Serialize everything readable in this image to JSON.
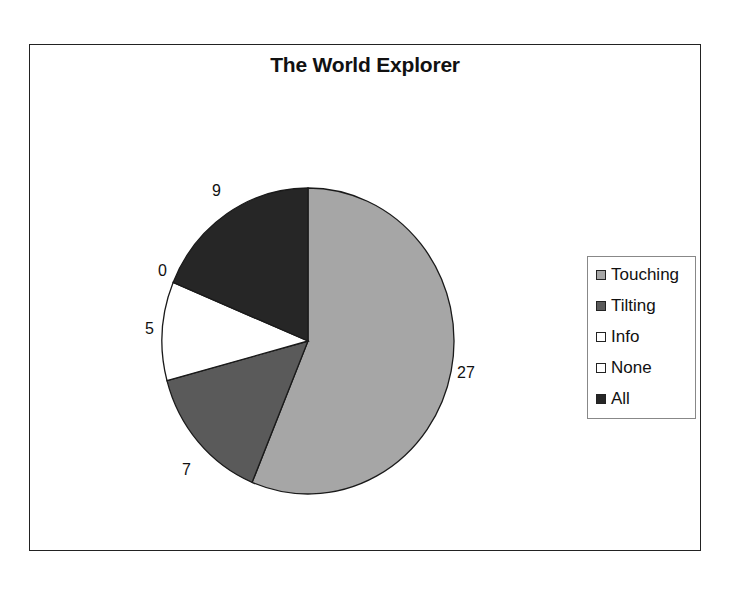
{
  "chart_data": {
    "type": "pie",
    "title": "The World Explorer",
    "categories": [
      "Touching",
      "Tilting",
      "Info",
      "None",
      "All"
    ],
    "values": [
      27,
      7,
      5,
      0,
      9
    ],
    "colors": [
      "#a6a6a6",
      "#5a5a5a",
      "#ffffff",
      "#ffffff",
      "#262626"
    ],
    "data_labels": [
      "27",
      "7",
      "5",
      "0",
      "9"
    ],
    "start_angle": "12 o'clock, clockwise",
    "legend_position": "right"
  },
  "legend": {
    "items": [
      {
        "label": "Touching",
        "color": "#a6a6a6"
      },
      {
        "label": "Tilting",
        "color": "#5a5a5a"
      },
      {
        "label": "Info",
        "color": "#ffffff"
      },
      {
        "label": "None",
        "color": "#ffffff"
      },
      {
        "label": "All",
        "color": "#262626"
      }
    ]
  }
}
